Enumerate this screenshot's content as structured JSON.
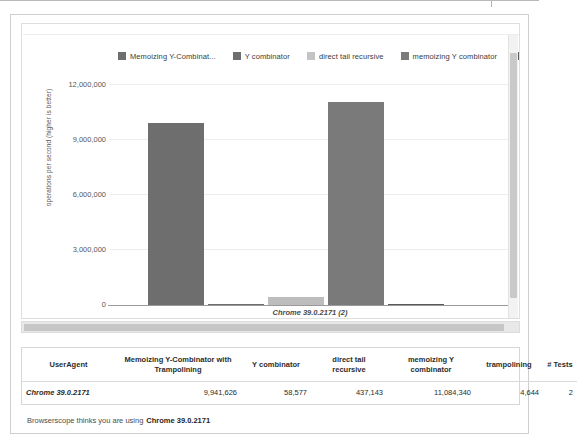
{
  "chart_data": {
    "type": "bar",
    "title": "",
    "xlabel": "Chrome 39.0.2171 (2)",
    "ylabel": "operations per second (higher is better)",
    "categories": [
      "Chrome 39.0.2171 (2)"
    ],
    "ylim": [
      0,
      12000000
    ],
    "ytick_labels": [
      "0",
      "3,000,000",
      "6,000,000",
      "9,000,000",
      "12,000,000"
    ],
    "ytick_values": [
      0,
      3000000,
      6000000,
      9000000,
      12000000
    ],
    "grid": true,
    "legend_position": "top",
    "series": [
      {
        "name": "Memoizing Y-Combinat...",
        "full_name": "Memoizing Y-Combinator with Trampolining",
        "values": [
          9941626
        ],
        "color": "#6e6e6e"
      },
      {
        "name": "Y combinator",
        "full_name": "Y combinator",
        "values": [
          58577
        ],
        "color": "#6e6e6e"
      },
      {
        "name": "direct tail recursive",
        "full_name": "direct tail recursive",
        "values": [
          437143
        ],
        "color": "#bdbdbd"
      },
      {
        "name": "memoizing Y combinator",
        "full_name": "memoizing Y combinator",
        "values": [
          11084340
        ],
        "color": "#7a7a7a"
      },
      {
        "name": "trampolinir",
        "full_name": "trampolining",
        "values": [
          4644
        ],
        "color": "#5a5a5a"
      }
    ]
  },
  "chart": {
    "xaxis_label": "Chrome 39.0.2171 (2)",
    "yaxis_title": "operations per second (higher is better)"
  },
  "table": {
    "headers": [
      "UserAgent",
      "Memoizing Y-Combinator with Trampolining",
      "Y combinator",
      "direct tail recursive",
      "memoizing Y combinator",
      "trampolining",
      "# Tests"
    ],
    "rows": [
      {
        "useragent": "Chrome 39.0.2171",
        "memoizing_y_combinator_with_trampolining": "9,941,626",
        "y_combinator": "58,577",
        "direct_tail_recursive": "437,143",
        "memoizing_y_combinator": "11,084,340",
        "trampolining": "4,644",
        "tests": "2"
      }
    ]
  },
  "footer": {
    "prefix": "Browserscope thinks you are using",
    "browser": "Chrome 39.0.2171"
  }
}
